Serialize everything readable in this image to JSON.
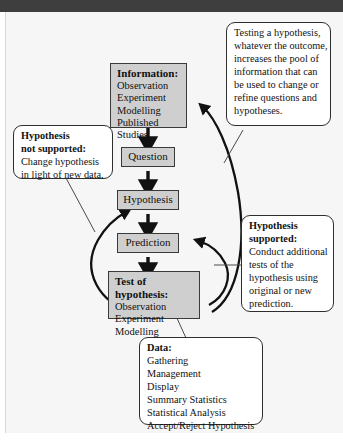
{
  "diagram": {
    "colors": {
      "process_fill": "#cfcfcf",
      "process_border": "#3a3a3a",
      "callout_fill": "#ffffff",
      "callout_border": "#2e2e2e",
      "page_background": "#f6f6f6",
      "top_band": "#3e3e3e",
      "arrow": "#111111"
    },
    "process_boxes": [
      {
        "id": "information",
        "header": "Information:",
        "items": [
          "Observation",
          "Experiment",
          "Modelling",
          "Published Studies"
        ]
      },
      {
        "id": "question",
        "label": "Question"
      },
      {
        "id": "hypothesis",
        "label": "Hypothesis"
      },
      {
        "id": "prediction",
        "label": "Prediction"
      },
      {
        "id": "test-of-hypothesis",
        "header": "Test of hypothesis:",
        "items": [
          "Observation",
          "Experiment",
          "Modelling"
        ]
      }
    ],
    "callouts": [
      {
        "id": "testing-a-hypothesis",
        "lines": [
          "Testing a hypothesis,",
          "whatever the outcome,",
          "increases the pool of",
          "information that can",
          "be used to change or",
          "refine questions and",
          "hypotheses."
        ]
      },
      {
        "id": "hypothesis-not-supported",
        "header_lines": [
          "Hypothesis",
          "not supported:"
        ],
        "lines": [
          "Change hypothesis",
          "in light of new data."
        ]
      },
      {
        "id": "hypothesis-supported",
        "header_lines": [
          "Hypothesis",
          "supported:"
        ],
        "lines": [
          "Conduct additional",
          "tests of the",
          "hypothesis using",
          "original or new",
          "prediction."
        ]
      },
      {
        "id": "data",
        "header_lines": [
          "Data:"
        ],
        "lines": [
          "Gathering",
          "Management",
          "Display",
          "Summary Statistics",
          "Statistical Analysis",
          "Accept/Reject Hypothesis"
        ]
      }
    ]
  }
}
